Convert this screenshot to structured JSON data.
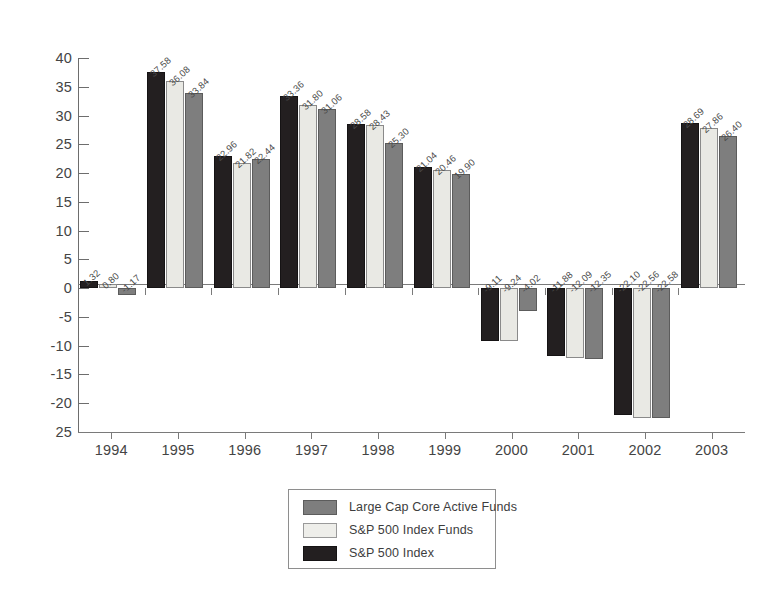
{
  "chart_data": {
    "type": "bar",
    "title": "",
    "xlabel": "",
    "ylabel": "",
    "categories": [
      "1994",
      "1995",
      "1996",
      "1997",
      "1998",
      "1999",
      "2000",
      "2001",
      "2002",
      "2003"
    ],
    "series": [
      {
        "name": "S&P 500 Index",
        "color": "#231f20",
        "values": [
          1.32,
          37.58,
          22.96,
          33.36,
          28.58,
          21.04,
          -9.11,
          -11.88,
          -22.1,
          28.69
        ],
        "labels": [
          "1.32",
          "37.58",
          "22.96",
          "33.36",
          "28.58",
          "21.04",
          "-9.11",
          "-11.88",
          "-22.10",
          "28.69"
        ]
      },
      {
        "name": "S&P 500 Index Funds",
        "color": "#e9e9e4",
        "values": [
          0.8,
          36.08,
          21.82,
          31.8,
          28.43,
          20.46,
          -9.24,
          -12.09,
          -22.56,
          27.86
        ],
        "labels": [
          "0.80",
          "36.08",
          "21.82",
          "31.80",
          "28.43",
          "20.46",
          "-9.24",
          "-12.09",
          "-22.56",
          "27.86"
        ]
      },
      {
        "name": "Large Cap Core Active Funds",
        "color": "#7e7e7e",
        "values": [
          -1.17,
          33.84,
          22.44,
          31.06,
          25.3,
          19.9,
          -4.02,
          -12.35,
          -22.58,
          26.4
        ],
        "labels": [
          "-1.17",
          "33.84",
          "22.44",
          "31.06",
          "25.30",
          "19.90",
          "-4.02",
          "-12.35",
          "-22.58",
          "26.40"
        ]
      }
    ],
    "ylim": [
      -25,
      40
    ],
    "yticks": [
      40,
      35,
      30,
      25,
      20,
      15,
      10,
      5,
      0,
      -5,
      -10,
      -15,
      -20,
      -25
    ],
    "ytick_labels": [
      "40",
      "35",
      "30",
      "25",
      "20",
      "15",
      "10",
      "5",
      "0",
      "-5",
      "-10",
      "-15",
      "-20",
      "25"
    ],
    "grid": false,
    "legend_position": "bottom-center",
    "legend_order": [
      "Large Cap Core Active Funds",
      "S&P 500 Index Funds",
      "S&P 500 Index"
    ]
  },
  "legend": {
    "items": [
      {
        "label": "Large Cap Core Active Funds",
        "swatch": "s2"
      },
      {
        "label": "S&P 500 Index Funds",
        "swatch": "s1"
      },
      {
        "label": "S&P 500 Index",
        "swatch": "s0"
      }
    ]
  }
}
